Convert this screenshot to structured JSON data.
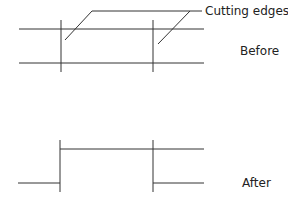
{
  "diagram": {
    "callout_label": "Cutting edges",
    "before_label": "Before",
    "after_label": "After",
    "line_color": "#333333"
  }
}
